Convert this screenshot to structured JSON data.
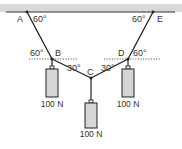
{
  "diagram": {
    "type": "static-equilibrium-strings",
    "ceiling_color": "#d9d9d9",
    "line_color": "#222222",
    "weight_fill": "#d6d6d6",
    "points": {
      "A": {
        "label": "A"
      },
      "B": {
        "label": "B"
      },
      "C": {
        "label": "C"
      },
      "D": {
        "label": "D"
      },
      "E": {
        "label": "E"
      }
    },
    "angles": {
      "at_A": "60°",
      "at_E": "60°",
      "at_B_left": "60°",
      "at_B_right": "30°",
      "at_D_left": "30°",
      "at_D_right": "60°"
    },
    "weights": [
      {
        "id": "left",
        "label": "100 N"
      },
      {
        "id": "center",
        "label": "100 N"
      },
      {
        "id": "right",
        "label": "100 N"
      }
    ]
  }
}
